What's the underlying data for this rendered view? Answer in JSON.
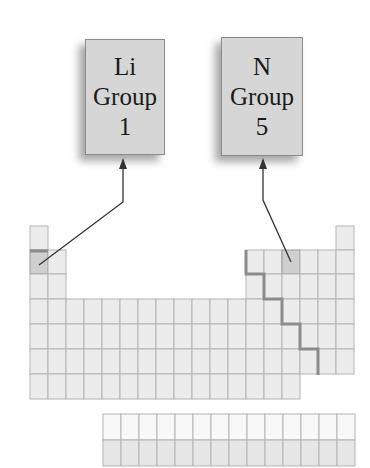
{
  "callouts": [
    {
      "id": "li",
      "element": "Li",
      "label": "Group",
      "group": "1"
    },
    {
      "id": "n",
      "element": "N",
      "label": "Group",
      "group": "5"
    }
  ],
  "table": {
    "columns": 18,
    "main_rows": 7,
    "f_block_rows": 2,
    "f_block_columns": 14,
    "highlighted_cells": [
      {
        "element": "Li",
        "row": 2,
        "column": 1
      },
      {
        "element": "N",
        "row": 2,
        "column": 15
      }
    ],
    "metal_nonmetal_staircase": true
  },
  "colors": {
    "cell_fill": "#ececec",
    "cell_border": "#b4b4b4",
    "highlight_fill": "#cfcfcf",
    "staircase": "#8c8c8c",
    "callout_fill": "#d6d6d6",
    "arrow": "#333333"
  }
}
